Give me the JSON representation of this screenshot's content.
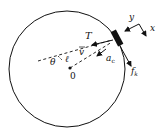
{
  "diagram": {
    "type": "free-body / circular motion",
    "labels": {
      "tension": "T",
      "velocity": "v",
      "angle": "θ",
      "length": "ℓ",
      "origin": "0",
      "centripetal_accel": "a",
      "centripetal_accel_sub": "c",
      "friction": "f",
      "friction_sub": "k",
      "axis_y": "y",
      "axis_x": "x"
    },
    "colors": {
      "stroke": "#111111",
      "background": "#ffffff"
    }
  }
}
